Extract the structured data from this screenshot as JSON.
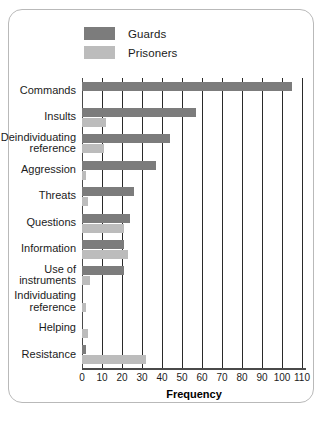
{
  "chart_data": {
    "type": "bar",
    "orientation": "horizontal",
    "title": "",
    "xlabel": "Frequency",
    "ylabel": "",
    "xlim": [
      0,
      112
    ],
    "xticks": [
      0,
      10,
      20,
      30,
      40,
      50,
      60,
      70,
      80,
      90,
      100,
      110
    ],
    "grid": true,
    "legend_position": "top-left",
    "categories": [
      "Commands",
      "Insults",
      "Deindividuating\nreference",
      "Aggression",
      "Threats",
      "Questions",
      "Information",
      "Use of\ninstruments",
      "Individuating\nreference",
      "Helping",
      "Resistance"
    ],
    "series": [
      {
        "name": "Guards",
        "color": "#7c7c7c",
        "values": [
          105,
          57,
          44,
          37,
          26,
          24,
          21,
          21,
          0,
          0,
          2
        ]
      },
      {
        "name": "Prisoners",
        "color": "#bcbcbc",
        "values": [
          0,
          12,
          11,
          2,
          3,
          21,
          23,
          4,
          2,
          3,
          32
        ]
      }
    ]
  },
  "axis": {
    "x_title": "Frequency"
  },
  "legend": {
    "items": [
      {
        "label": "Guards",
        "color": "#7c7c7c"
      },
      {
        "label": "Prisoners",
        "color": "#bcbcbc"
      }
    ]
  }
}
